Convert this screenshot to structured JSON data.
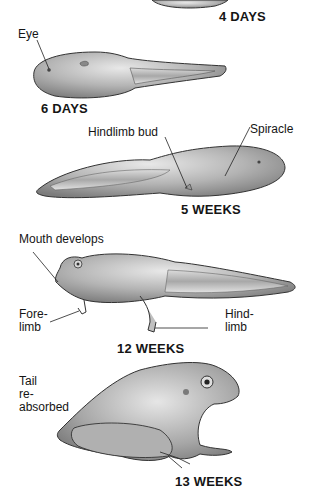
{
  "diagram": {
    "type": "frog-life-cycle",
    "stages": [
      {
        "id": "4-days",
        "label": "4 DAYS"
      },
      {
        "id": "6-days",
        "label": "6 DAYS",
        "annotations": [
          "Eye"
        ]
      },
      {
        "id": "5-weeks",
        "label": "5 WEEKS",
        "annotations": [
          "Hindlimb bud",
          "Spiracle"
        ]
      },
      {
        "id": "12-weeks",
        "label": "12 WEEKS",
        "annotations": [
          "Mouth develops",
          "Fore-\nlimb",
          "Hind-\nlimb"
        ]
      },
      {
        "id": "13-weeks",
        "label": "13 WEEKS",
        "annotations": [
          "Tail\nre-\nabsorbed"
        ]
      }
    ],
    "colors": {
      "body_fill": "#b8b8b8",
      "body_highlight": "#e4e4e4",
      "body_shadow": "#7a7a7a",
      "outline": "#333333",
      "tail_fin": "#d6d6d6",
      "text": "#151515"
    }
  }
}
